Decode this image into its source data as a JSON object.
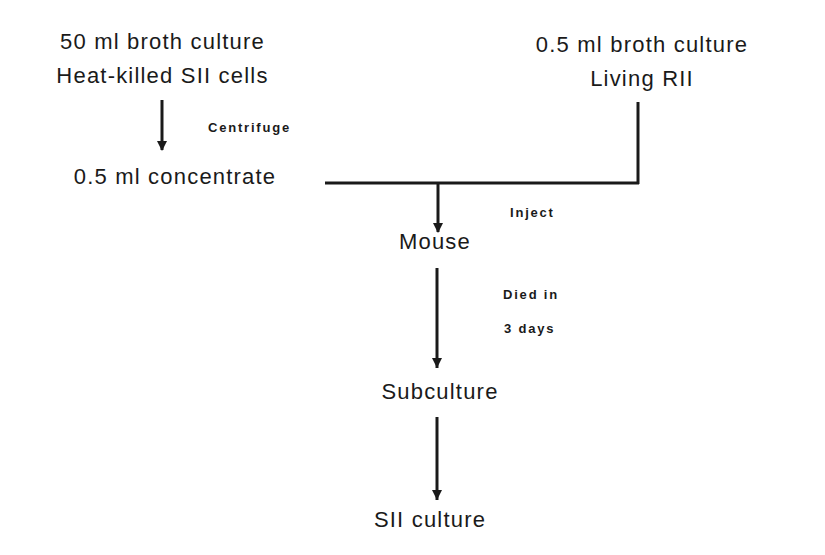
{
  "nodes": {
    "source_left": {
      "line1": "50 ml broth culture",
      "line2": "Heat-killed SII cells"
    },
    "source_right": {
      "line1": "0.5 ml broth culture",
      "line2": "Living RII"
    },
    "concentrate": "0.5 ml concentrate",
    "mouse": "Mouse",
    "subculture": "Subculture",
    "result": "SII culture"
  },
  "edge_labels": {
    "centrifuge": "Centrifuge",
    "inject": "Inject",
    "died_line1": "Died in",
    "died_line2": "3 days"
  },
  "colors": {
    "ink": "#1a1a1a",
    "background": "#ffffff"
  }
}
